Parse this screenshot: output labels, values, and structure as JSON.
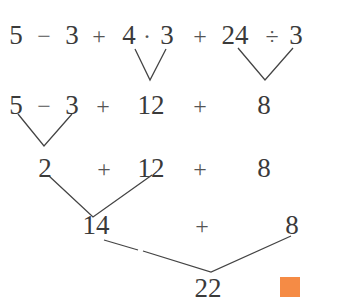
{
  "diagram": {
    "type": "order-of-operations-tree",
    "rows": [
      {
        "tokens": [
          "5",
          "−",
          "3",
          "+",
          "4",
          "·",
          "3",
          "+",
          "24",
          "÷",
          "3"
        ]
      },
      {
        "tokens": [
          "5",
          "−",
          "3",
          "+",
          "12",
          "+",
          "8"
        ]
      },
      {
        "tokens": [
          "2",
          "+",
          "12",
          "+",
          "8"
        ]
      },
      {
        "tokens": [
          "14",
          "+",
          "8"
        ]
      },
      {
        "tokens": [
          "22"
        ]
      }
    ],
    "end_marker_color": "#f58b45"
  }
}
